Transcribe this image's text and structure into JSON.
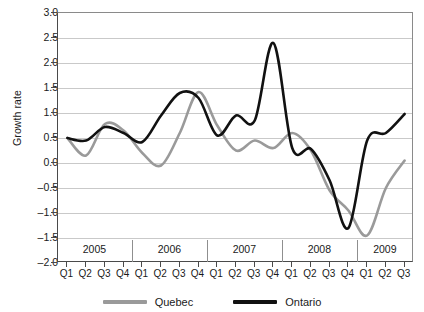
{
  "chart_data": {
    "type": "line",
    "title": "",
    "xlabel": "",
    "ylabel": "Growth rate",
    "ylim": [
      -2.0,
      3.0
    ],
    "ytick_step": 0.5,
    "yticks": [
      "3.0",
      "2.5",
      "2.0",
      "1.5",
      "1.0",
      "0.5",
      "0.0",
      "-0.5",
      "-1.0",
      "-1.5",
      "-2.0"
    ],
    "ytick_values": [
      3.0,
      2.5,
      2.0,
      1.5,
      1.0,
      0.5,
      0.0,
      -0.5,
      -1.0,
      -1.5,
      -2.0
    ],
    "grid": true,
    "legend_position": "bottom-center",
    "categories": [
      "Q1",
      "Q2",
      "Q3",
      "Q4",
      "Q1",
      "Q2",
      "Q3",
      "Q4",
      "Q1",
      "Q2",
      "Q3",
      "Q4",
      "Q1",
      "Q2",
      "Q3",
      "Q4",
      "Q1",
      "Q2",
      "Q3"
    ],
    "year_groups": [
      {
        "label": "2005",
        "start_index": 0,
        "end_index": 3
      },
      {
        "label": "2006",
        "start_index": 4,
        "end_index": 7
      },
      {
        "label": "2007",
        "start_index": 8,
        "end_index": 11
      },
      {
        "label": "2008",
        "start_index": 12,
        "end_index": 15
      },
      {
        "label": "2009",
        "start_index": 16,
        "end_index": 18
      }
    ],
    "series": [
      {
        "name": "Quebec",
        "color": "#9a9a9a",
        "values": [
          0.5,
          0.15,
          0.78,
          0.65,
          0.2,
          -0.05,
          0.6,
          1.42,
          0.75,
          0.25,
          0.45,
          0.3,
          0.6,
          0.25,
          -0.55,
          -0.95,
          -1.45,
          -0.5,
          0.05
        ]
      },
      {
        "name": "Ontario",
        "color": "#111111",
        "values": [
          0.5,
          0.45,
          0.72,
          0.6,
          0.42,
          0.95,
          1.4,
          1.3,
          0.55,
          0.95,
          0.85,
          2.4,
          0.3,
          0.28,
          -0.35,
          -1.3,
          0.45,
          0.6,
          0.98
        ]
      }
    ]
  },
  "legend": {
    "items": [
      {
        "label": "Quebec",
        "color": "#9a9a9a",
        "name": "legend-item-quebec"
      },
      {
        "label": "Ontario",
        "color": "#111111",
        "name": "legend-item-ontario"
      }
    ]
  }
}
